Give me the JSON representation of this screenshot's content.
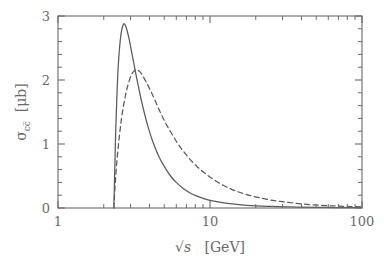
{
  "figure": {
    "name": "charm-quark-pair-production-cross-section",
    "background_color": "#ffffff",
    "frame_color": "#6a6a6a"
  },
  "axes": {
    "x": {
      "label_prefix": "√s",
      "label_units": "[GeV]",
      "label_full": "√s  [GeV]",
      "scale": "log",
      "min": 1,
      "max": 100,
      "major_ticks": [
        1,
        10,
        100
      ],
      "major_tick_labels": [
        "1",
        "10",
        "100"
      ],
      "minor_ticks": [
        2,
        3,
        4,
        5,
        6,
        7,
        8,
        9,
        20,
        30,
        40,
        50,
        60,
        70,
        80,
        90
      ]
    },
    "y": {
      "label_sigma": "σ",
      "label_subscript": "cc̅",
      "label_units": "[μb]",
      "label_full": "σcc̅ [μb]",
      "scale": "linear",
      "min": 0,
      "max": 3,
      "major_ticks": [
        0,
        1,
        2,
        3
      ],
      "major_tick_labels": [
        "0",
        "1",
        "2",
        "3"
      ],
      "minor_subdivisions": 5
    }
  },
  "chart_data": {
    "type": "line",
    "title": "",
    "xlabel": "√s  [GeV]",
    "ylabel": "σcc̅ [μb]",
    "xscale": "log",
    "yscale": "linear",
    "xlim": [
      1,
      100
    ],
    "ylim": [
      0,
      3
    ],
    "grid": false,
    "legend": "none",
    "series": [
      {
        "name": "solid-curve",
        "style": "solid",
        "color": "#5a5a5a",
        "threshold_x": 2.33,
        "peak_x": 2.72,
        "peak_y": 2.88,
        "x": [
          2.33,
          2.36,
          2.4,
          2.45,
          2.5,
          2.56,
          2.62,
          2.68,
          2.72,
          2.78,
          2.85,
          2.95,
          3.05,
          3.2,
          3.4,
          3.6,
          3.9,
          4.2,
          4.6,
          5.0,
          5.5,
          6.0,
          6.7,
          7.4,
          8.2,
          9.0,
          10.0,
          11.5,
          13.0,
          15.0,
          17.5,
          20.0,
          24.0,
          28.0,
          34.0,
          40.0,
          50.0,
          65.0,
          80.0,
          100.0
        ],
        "y": [
          0.0,
          0.55,
          1.25,
          1.85,
          2.28,
          2.59,
          2.77,
          2.86,
          2.88,
          2.85,
          2.77,
          2.62,
          2.44,
          2.18,
          1.87,
          1.6,
          1.28,
          1.04,
          0.81,
          0.65,
          0.5,
          0.4,
          0.3,
          0.235,
          0.185,
          0.15,
          0.118,
          0.09,
          0.072,
          0.055,
          0.042,
          0.034,
          0.026,
          0.021,
          0.016,
          0.013,
          0.01,
          0.007,
          0.005,
          0.004
        ]
      },
      {
        "name": "dashed-curve",
        "style": "dashed",
        "color": "#5a5a5a",
        "threshold_x": 2.33,
        "peak_x": 3.3,
        "peak_y": 2.16,
        "x": [
          2.33,
          2.38,
          2.45,
          2.55,
          2.65,
          2.78,
          2.9,
          3.05,
          3.2,
          3.3,
          3.45,
          3.6,
          3.8,
          4.05,
          4.35,
          4.7,
          5.1,
          5.6,
          6.2,
          6.9,
          7.7,
          8.6,
          9.6,
          10.8,
          12.2,
          14.0,
          16.0,
          18.5,
          21.5,
          25.0,
          29.0,
          34.0,
          40.0,
          48.0,
          58.0,
          70.0,
          85.0,
          100.0
        ],
        "y": [
          0.0,
          0.38,
          0.78,
          1.18,
          1.49,
          1.76,
          1.94,
          2.09,
          2.15,
          2.16,
          2.13,
          2.07,
          1.97,
          1.84,
          1.68,
          1.5,
          1.33,
          1.16,
          0.99,
          0.845,
          0.715,
          0.605,
          0.515,
          0.43,
          0.355,
          0.288,
          0.238,
          0.194,
          0.156,
          0.126,
          0.102,
          0.082,
          0.065,
          0.05,
          0.038,
          0.03,
          0.023,
          0.018
        ]
      }
    ]
  }
}
